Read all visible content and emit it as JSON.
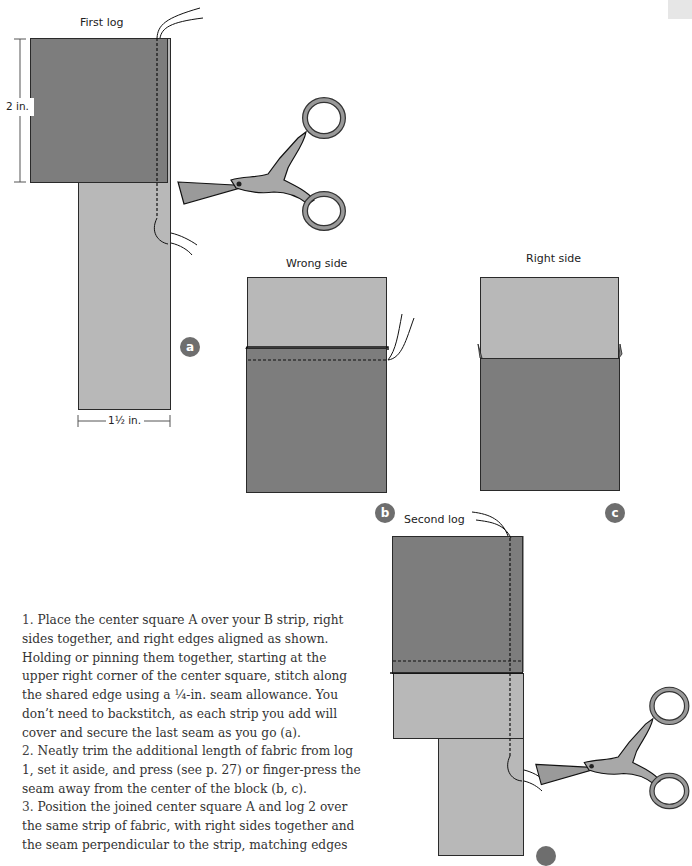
{
  "figures": {
    "a": {
      "badge": "a",
      "title": "First log",
      "height_dim": "2 in.",
      "width_dim": "1½ in."
    },
    "b": {
      "badge": "b",
      "title": "Wrong side"
    },
    "c": {
      "badge": "c",
      "title": "Right side"
    },
    "d": {
      "title": "Second log"
    }
  },
  "colors": {
    "dark_fabric": "#7d7d7d",
    "light_fabric": "#b8b8b8",
    "badge": "#6e6e6e",
    "outline": "#2a2a2a"
  },
  "instructions": [
    {
      "number": "1.",
      "text": "Place the center square A over your B strip, right sides together, and right edges aligned as shown. Holding or pinning them together, starting at the upper right corner of the center square, stitch along the shared edge using a ¼-in. seam allowance. You don’t need to backstitch, as each strip you add will cover and secure the last seam as you go (a)."
    },
    {
      "number": "2.",
      "text": "Neatly trim the additional length of fabric from log 1, set it aside, and press (see p. 27) or finger-press the seam away from the center of the block (b, c)."
    },
    {
      "number": "3.",
      "text": "Position the joined center square A and log 2 over the same strip of fabric, with right sides together and the seam perpendicular to the strip, matching edges"
    }
  ]
}
